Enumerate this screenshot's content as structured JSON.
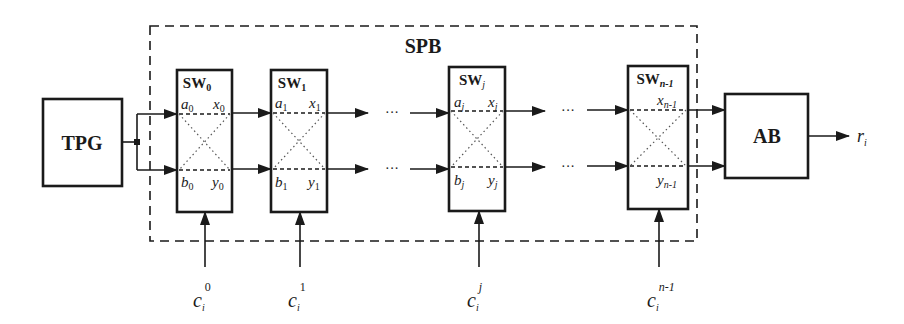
{
  "diagram": {
    "type": "block-diagram",
    "colors": {
      "stroke": "#1a1a1a",
      "background": "#ffffff"
    },
    "blocks": {
      "tpg": {
        "label": "TPG"
      },
      "spb": {
        "label": "SPB"
      },
      "ab": {
        "label": "AB"
      }
    },
    "switches": [
      {
        "name": "SW",
        "sub": "0",
        "in_a": "a",
        "in_a_sub": "0",
        "in_b": "b",
        "in_b_sub": "0",
        "out_x": "x",
        "out_x_sub": "0",
        "out_y": "y",
        "out_y_sub": "0",
        "control": "c",
        "control_sub": "i",
        "control_sup": "0"
      },
      {
        "name": "SW",
        "sub": "1",
        "in_a": "a",
        "in_a_sub": "1",
        "in_b": "b",
        "in_b_sub": "1",
        "out_x": "x",
        "out_x_sub": "1",
        "out_y": "y",
        "out_y_sub": "1",
        "control": "c",
        "control_sub": "i",
        "control_sup": "1"
      },
      {
        "name": "SW",
        "sub": "j",
        "in_a": "a",
        "in_a_sub": "j",
        "in_b": "b",
        "in_b_sub": "j",
        "out_x": "x",
        "out_x_sub": "j",
        "out_y": "y",
        "out_y_sub": "j",
        "control": "c",
        "control_sub": "i",
        "control_sup": "j"
      },
      {
        "name": "SW",
        "sub": "n-1",
        "out_x": "x",
        "out_x_sub": "n-1",
        "out_y": "y",
        "out_y_sub": "n-1",
        "control": "c",
        "control_sub": "i",
        "control_sup": "n-1"
      }
    ],
    "ellipsis": "···",
    "output": {
      "label": "r",
      "sub": "i"
    }
  }
}
